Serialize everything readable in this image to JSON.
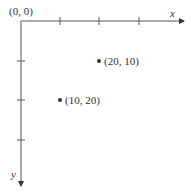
{
  "diagram": {
    "origin_label": "(0, 0)",
    "x_axis_label": "x",
    "y_axis_label": "y",
    "x_ticks": [
      60,
      99,
      139
    ],
    "y_ticks": [
      61,
      100,
      140
    ],
    "points": [
      {
        "label": "(20, 10)",
        "x": 20,
        "y": 10
      },
      {
        "label": "(10, 20)",
        "x": 10,
        "y": 20
      }
    ],
    "line_color": "#333333"
  }
}
